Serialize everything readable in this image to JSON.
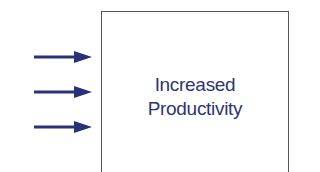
{
  "diagram": {
    "box": {
      "label_line1": "Increased",
      "label_line2": "Productivity"
    },
    "arrows": [
      {
        "direction": "right",
        "target": "box"
      },
      {
        "direction": "right",
        "target": "box"
      },
      {
        "direction": "right",
        "target": "box"
      }
    ],
    "colors": {
      "arrow": "#27327a",
      "text": "#2e3570",
      "border": "#555555"
    }
  }
}
